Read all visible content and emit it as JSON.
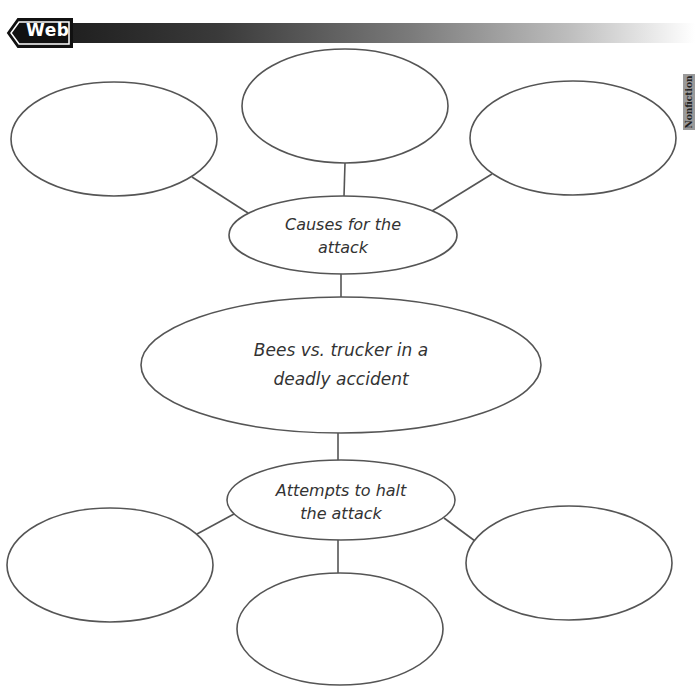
{
  "header": {
    "tag_label": "Web",
    "side_tab_label": "Nonfiction"
  },
  "colors": {
    "stroke": "#555555",
    "text": "#333333",
    "bar_dark": "#1e1e1e"
  },
  "diagram": {
    "center": {
      "line1": "Bees vs. trucker in a",
      "line2": "deadly accident"
    },
    "upper_hub": {
      "line1": "Causes for the",
      "line2": "attack",
      "children": [
        "",
        "",
        ""
      ]
    },
    "lower_hub": {
      "line1": "Attempts to halt",
      "line2": "the attack",
      "children": [
        "",
        "",
        ""
      ]
    }
  }
}
